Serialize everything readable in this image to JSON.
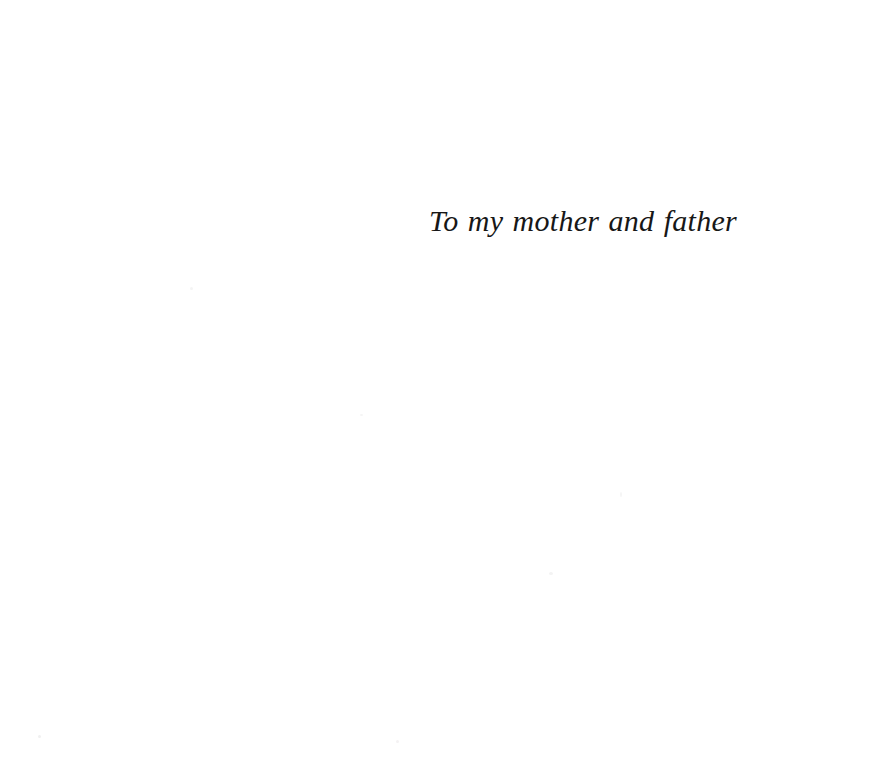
{
  "page": {
    "kind": "book-dedication-page",
    "background_color": "#ffffff",
    "text_color": "#171717",
    "width": 887,
    "height": 765
  },
  "dedication": {
    "text": "To my mother and father",
    "style": "italic-serif",
    "alignment": "right-of-center",
    "font_size_px": 30
  },
  "artifacts": {
    "specks": [
      {
        "name": "speck-a",
        "x": 38,
        "y": 735
      },
      {
        "name": "speck-b",
        "x": 396,
        "y": 740
      },
      {
        "name": "speck-c",
        "x": 620,
        "y": 492
      },
      {
        "name": "speck-d",
        "x": 549,
        "y": 572
      },
      {
        "name": "speck-e",
        "x": 190,
        "y": 287
      },
      {
        "name": "speck-f",
        "x": 360,
        "y": 414
      }
    ]
  }
}
